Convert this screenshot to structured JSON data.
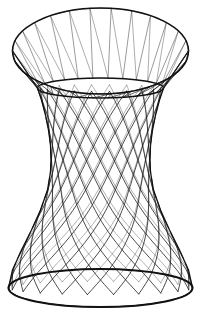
{
  "image": {
    "subject": "wireframe hyperboloid stool",
    "description": "Line drawing of a wire-frame hourglass / hyperboloid stool seen in three-quarter view",
    "width": 201,
    "height": 312,
    "background_color": "#ffffff",
    "line_color": "#1a1a1a",
    "rim_color": "#111111"
  },
  "geometry": {
    "center_x": 100.5,
    "top_rim": {
      "name": "top-rim-ellipse",
      "cy": 51,
      "rx": 88,
      "ry": 43,
      "stroke_width": 1.5
    },
    "neck_ring": {
      "name": "neck-ring-ellipse",
      "cy": 88,
      "rx": 63,
      "ry": 10,
      "stroke_width": 1.6
    },
    "bottom_rim": {
      "name": "bottom-rim-ellipse",
      "cy": 288,
      "rx": 92,
      "ry": 19,
      "stroke_width": 2.0
    },
    "waist": {
      "cy": 172,
      "rx": 50
    },
    "profile_samples": [
      {
        "y": 88,
        "rx": 63
      },
      {
        "y": 100,
        "rx": 59
      },
      {
        "y": 115,
        "rx": 55
      },
      {
        "y": 130,
        "rx": 52
      },
      {
        "y": 145,
        "rx": 50
      },
      {
        "y": 160,
        "rx": 49.5
      },
      {
        "y": 172,
        "rx": 50
      },
      {
        "y": 190,
        "rx": 53
      },
      {
        "y": 210,
        "rx": 60
      },
      {
        "y": 230,
        "rx": 69
      },
      {
        "y": 250,
        "rx": 79
      },
      {
        "y": 270,
        "rx": 88
      },
      {
        "y": 288,
        "rx": 92
      }
    ],
    "counts": {
      "top_cone_wires": 26,
      "body_helix_count": 22,
      "body_twist_steps": 7,
      "top_zigzag_segments": 26
    },
    "strokes": {
      "top_wire_width": 0.8,
      "body_wire_width": 0.85,
      "outline_width": 1.3
    }
  },
  "labels": {
    "part_top_rim": "Top rim",
    "part_neck": "Neck ring",
    "part_body": "Hyperboloid body",
    "part_base": "Base rim"
  }
}
